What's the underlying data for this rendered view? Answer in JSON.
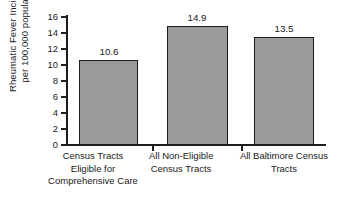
{
  "chart_data": {
    "type": "bar",
    "title": "",
    "xlabel": "",
    "ylabel": "Rheumatic Fever Incidence per 100,000 population",
    "ylabel_lines": [
      "Rheumatic Fever Incidence",
      "per 100,000 population"
    ],
    "categories": [
      "Census Tracts Eligible for Comprehensive Care",
      "All Non-Eligible Census Tracts",
      "All Baltimore Census Tracts"
    ],
    "category_lines": [
      [
        "Census Tracts",
        "Eligible for",
        "Comprehensive Care"
      ],
      [
        "All Non-Eligible",
        "Census Tracts"
      ],
      [
        "All Baltimore Census",
        "Tracts"
      ]
    ],
    "values": [
      10.6,
      14.9,
      13.5
    ],
    "value_labels": [
      "10.6",
      "14.9",
      "13.5"
    ],
    "ylim": [
      0,
      16
    ],
    "ytick_step": 2,
    "ytick_labels": [
      "16",
      "14",
      "12",
      "10",
      "8",
      "6",
      "4",
      "2",
      "0"
    ],
    "ytick_values": [
      16,
      14,
      12,
      10,
      8,
      6,
      4,
      2,
      0
    ],
    "grid": false,
    "legend": null,
    "bar_fill_color": "#9a9a9a",
    "bar_edge_color": "#1d1d1d",
    "axis_color": "#1d1d1d",
    "background_color": "#ffffff"
  }
}
